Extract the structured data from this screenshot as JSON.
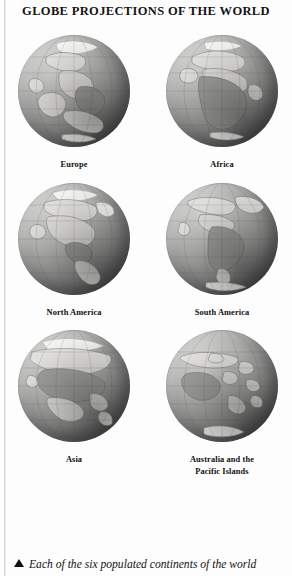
{
  "page": {
    "title": "GLOBE PROJECTIONS OF THE WORLD",
    "caption": "Each of the six populated continents of the world",
    "caption_marker_icon": "solid-triangle-up-icon",
    "background_color": "#fdfdfd",
    "text_color": "#141414"
  },
  "globes": [
    {
      "label": "Europe",
      "label_line2": "",
      "image_name": "globe-europe"
    },
    {
      "label": "Africa",
      "label_line2": "",
      "image_name": "globe-africa"
    },
    {
      "label": "North America",
      "label_line2": "",
      "image_name": "globe-north-america"
    },
    {
      "label": "South America",
      "label_line2": "",
      "image_name": "globe-south-america"
    },
    {
      "label": "Asia",
      "label_line2": "",
      "image_name": "globe-asia"
    },
    {
      "label": "Australia and the",
      "label_line2": "Pacific Islands",
      "image_name": "globe-australia-pacific"
    }
  ]
}
